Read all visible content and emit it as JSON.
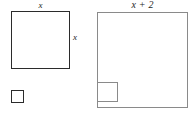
{
  "figure": {
    "background_color": "#ffffff",
    "shapes": [
      {
        "name": "small-square",
        "kind": "square",
        "side_label": "x",
        "stroke_color": "#2b2b2b",
        "stroke_width_px": 1.6,
        "x_px": 11,
        "y_px": 11,
        "width_px": 59,
        "height_px": 58,
        "right_angle_mark": {
          "corner": "bottom-left",
          "size_px": 13
        }
      },
      {
        "name": "large-square",
        "kind": "square",
        "side_label": "x + 2",
        "stroke_color": "#8a8a8a",
        "stroke_width_px": 1.1,
        "x_px": 97,
        "y_px": 12,
        "width_px": 91,
        "height_px": 96,
        "right_angle_mark": {
          "corner": "bottom-left",
          "size_px": 21
        }
      }
    ],
    "labels": {
      "small_square_top": "x",
      "small_square_right": "x",
      "large_square_top": "x + 2"
    }
  }
}
